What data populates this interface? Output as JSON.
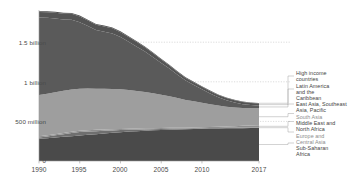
{
  "chart_data": {
    "type": "area",
    "title": "",
    "subtitle": "",
    "xlabel": "",
    "ylabel": "",
    "stacked": true,
    "grid": true,
    "legend_position": "right",
    "xlim": [
      1990,
      2017
    ],
    "ylim": [
      0,
      1900000000
    ],
    "x": [
      1990,
      1991,
      1992,
      1993,
      1994,
      1995,
      1996,
      1997,
      1998,
      1999,
      2000,
      2001,
      2002,
      2003,
      2004,
      2005,
      2006,
      2007,
      2008,
      2009,
      2010,
      2011,
      2012,
      2013,
      2014,
      2015,
      2016,
      2017
    ],
    "xtick_labels": [
      "1990",
      "1995",
      "2000",
      "2005",
      "2010",
      "2017"
    ],
    "xticks": [
      1990,
      1995,
      2000,
      2005,
      2010,
      2017
    ],
    "ytick_labels": [
      "0",
      "500 million",
      "1 billion",
      "1.5 billion"
    ],
    "yticks": [
      0,
      500000000,
      1000000000,
      1500000000
    ],
    "series": [
      {
        "name": "Sub-Saharan Africa",
        "color": "#4a4a4a",
        "values": [
          280000000,
          288000000,
          296000000,
          305000000,
          313000000,
          322000000,
          331000000,
          339000000,
          348000000,
          356000000,
          364000000,
          371000000,
          377000000,
          383000000,
          388000000,
          392000000,
          396000000,
          399000000,
          401000000,
          404000000,
          406000000,
          409000000,
          411000000,
          413000000,
          414000000,
          415000000,
          416000000,
          417000000
        ]
      },
      {
        "name": "Europe and Central Asia",
        "color": "#6f6f6f",
        "values": [
          18000000,
          22000000,
          28000000,
          34000000,
          40000000,
          44000000,
          42000000,
          38000000,
          34000000,
          30000000,
          26000000,
          22000000,
          19000000,
          16000000,
          14000000,
          12000000,
          11000000,
          10000000,
          9000000,
          9000000,
          8000000,
          8000000,
          7000000,
          7000000,
          7000000,
          7000000,
          7000000,
          7000000
        ]
      },
      {
        "name": "Middle East and North Africa",
        "color": "#8f8f8f",
        "values": [
          14000000,
          14000000,
          15000000,
          15000000,
          16000000,
          16000000,
          16000000,
          16000000,
          16000000,
          16000000,
          15000000,
          15000000,
          14000000,
          14000000,
          13000000,
          13000000,
          12000000,
          11000000,
          11000000,
          11000000,
          12000000,
          13000000,
          14000000,
          16000000,
          19000000,
          22000000,
          25000000,
          28000000
        ]
      },
      {
        "name": "South Asia",
        "color": "#9e9e9e",
        "values": [
          520000000,
          525000000,
          530000000,
          532000000,
          535000000,
          530000000,
          525000000,
          520000000,
          515000000,
          508000000,
          500000000,
          488000000,
          474000000,
          458000000,
          440000000,
          420000000,
          398000000,
          374000000,
          350000000,
          330000000,
          310000000,
          288000000,
          268000000,
          250000000,
          236000000,
          224000000,
          218000000,
          214000000
        ]
      },
      {
        "name": "East Asia, Southeast Asia, Pacific",
        "color": "#5a5a5a",
        "values": [
          980000000,
          960000000,
          930000000,
          900000000,
          880000000,
          840000000,
          790000000,
          740000000,
          720000000,
          700000000,
          660000000,
          610000000,
          560000000,
          510000000,
          455000000,
          400000000,
          350000000,
          295000000,
          245000000,
          205000000,
          170000000,
          135000000,
          105000000,
          82000000,
          64000000,
          50000000,
          40000000,
          33000000
        ]
      },
      {
        "name": "Latin America and the Caribbean",
        "color": "#545454",
        "values": [
          68000000,
          70000000,
          72000000,
          73000000,
          74000000,
          72000000,
          70000000,
          67000000,
          66000000,
          65000000,
          62000000,
          60000000,
          58000000,
          55000000,
          50000000,
          45000000,
          40000000,
          36000000,
          33000000,
          32000000,
          30000000,
          29000000,
          28000000,
          27000000,
          26000000,
          26000000,
          26000000,
          26000000
        ]
      },
      {
        "name": "High income countries",
        "color": "#4f4f4f",
        "values": [
          12000000,
          12000000,
          12000000,
          12000000,
          12000000,
          12000000,
          11000000,
          11000000,
          11000000,
          11000000,
          11000000,
          10000000,
          10000000,
          10000000,
          10000000,
          9000000,
          9000000,
          9000000,
          9000000,
          9000000,
          9000000,
          9000000,
          8000000,
          8000000,
          8000000,
          8000000,
          8000000,
          8000000
        ]
      }
    ],
    "totals": [
      1892000000,
      1891000000,
      1883000000,
      1871000000,
      1870000000,
      1836000000,
      1785000000,
      1731000000,
      1710000000,
      1686000000,
      1638000000,
      1576000000,
      1512000000,
      1446000000,
      1370000000,
      1291000000,
      1216000000,
      1134000000,
      1058000000,
      1000000000,
      945000000,
      891000000,
      841000000,
      803000000,
      774000000,
      752000000,
      740000000,
      733000000
    ]
  },
  "legend": {
    "entries": [
      {
        "label": "High income\ncountries",
        "faint": false
      },
      {
        "label": "Latin America\nand the\nCaribbean",
        "faint": false
      },
      {
        "label": "East Asia, Southeast\nAsia, Pacific",
        "faint": false
      },
      {
        "label": "South Asia",
        "faint": true
      },
      {
        "label": "Middle East and\nNorth Africa",
        "faint": false
      },
      {
        "label": "Europe and\nCentral Asia",
        "faint": true
      },
      {
        "label": "Sub-Saharan\nAfrica",
        "faint": false
      }
    ]
  },
  "axis": {
    "y_labels": [
      "1.5 billion",
      "1 billion",
      "500 million",
      "0"
    ],
    "x_labels": [
      "1990",
      "1995",
      "2000",
      "2005",
      "2010",
      "2017"
    ]
  }
}
